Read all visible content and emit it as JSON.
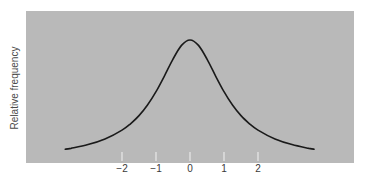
{
  "chart_data": {
    "type": "line",
    "title": "",
    "xlabel": "",
    "ylabel": "Relative frequency",
    "x_ticks": [
      -2,
      -1,
      0,
      1,
      2
    ],
    "x_tick_labels": [
      "−2",
      "−1",
      "0",
      "1",
      "2"
    ],
    "xlim": [
      -3.67,
      3.65
    ],
    "ylim": [
      0,
      1.05
    ],
    "y_ticks": [],
    "grid": false,
    "legend": null,
    "series": [
      {
        "name": "distribution",
        "color": "#1a1a1a",
        "x": [
          -3.67,
          -3.5,
          -3.0,
          -2.5,
          -2.0,
          -1.75,
          -1.5,
          -1.25,
          -1.0,
          -0.75,
          -0.5,
          -0.25,
          0.0,
          0.25,
          0.5,
          0.75,
          1.0,
          1.25,
          1.5,
          1.75,
          2.0,
          2.5,
          3.0,
          3.5,
          3.65
        ],
        "values": [
          0.09,
          0.097,
          0.128,
          0.175,
          0.249,
          0.302,
          0.37,
          0.458,
          0.569,
          0.702,
          0.841,
          0.955,
          1.0,
          0.955,
          0.841,
          0.702,
          0.569,
          0.458,
          0.37,
          0.302,
          0.249,
          0.175,
          0.128,
          0.097,
          0.09
        ]
      }
    ]
  },
  "panel": {
    "background": "#b9b9b9",
    "tick_color": "#f2f2f2"
  }
}
